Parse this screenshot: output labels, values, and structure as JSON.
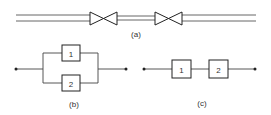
{
  "diagram": {
    "a": {
      "label": "(a)",
      "description": "pipe with two valves in series"
    },
    "b": {
      "label": "(b)",
      "blocks": [
        "1",
        "2"
      ],
      "arrangement": "parallel"
    },
    "c": {
      "label": "(c)",
      "blocks": [
        "1",
        "2"
      ],
      "arrangement": "series"
    },
    "colors": {
      "stroke": "#222222",
      "background": "#ffffff"
    }
  }
}
